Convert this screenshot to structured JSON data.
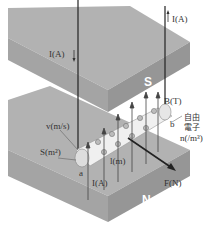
{
  "diagram": {
    "type": "physics-illustration",
    "magnets": {
      "top": {
        "label": "S"
      },
      "bottom": {
        "label": "N"
      }
    },
    "labels": {
      "current_top": "I(A)",
      "current_left": "I(A)",
      "field": "B(T)",
      "free_electron_1": "自由",
      "free_electron_2": "電子",
      "density": "n(/m³)",
      "velocity": "v(m/s)",
      "area": "S(m²)",
      "length": "l(m)",
      "current_bottom": "I(A)",
      "force": "F(N)",
      "end_a": "a",
      "end_b": "b"
    },
    "colors": {
      "magnet_top": "#a9a9a9",
      "magnet_side": "#9a9a9a",
      "magnet_front": "#8f8f8f",
      "conductor": "#eeeeee",
      "arrow": "#333333",
      "background": "#ffffff"
    }
  }
}
